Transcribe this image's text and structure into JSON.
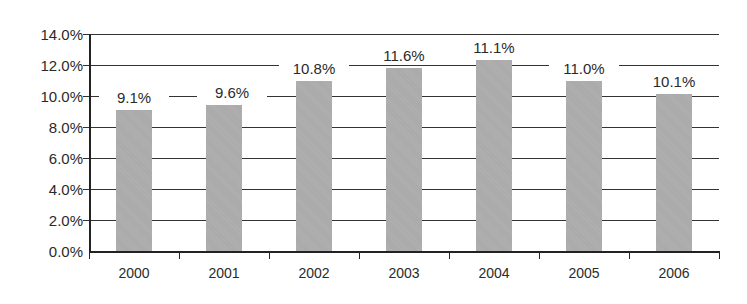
{
  "chart_data": {
    "type": "bar",
    "title": "",
    "xlabel": "",
    "ylabel": "",
    "categories": [
      "2000",
      "2001",
      "2002",
      "2003",
      "2004",
      "2005",
      "2006"
    ],
    "values": [
      9.1,
      9.6,
      10.8,
      11.6,
      11.1,
      11.0,
      10.1
    ],
    "data_labels": [
      "9.1%",
      "9.6%",
      "10.8%",
      "11.6%",
      "11.1%",
      "11.0%",
      "10.1%"
    ],
    "bar_heights_as_drawn": [
      9.1,
      9.4,
      11.0,
      11.8,
      12.3,
      11.0,
      10.1
    ],
    "ylim": [
      0,
      14
    ],
    "yticks": [
      "0.0%",
      "2.0%",
      "4.0%",
      "6.0%",
      "8.0%",
      "10.0%",
      "12.0%",
      "14.0%"
    ],
    "grid": true,
    "legend": null,
    "bar_color": "#a9a9a9"
  }
}
